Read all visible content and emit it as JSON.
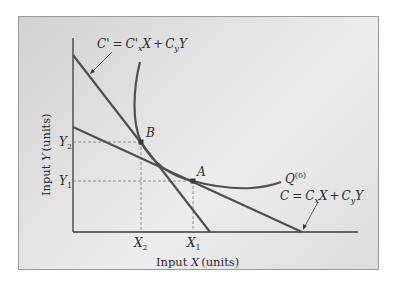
{
  "diagram": {
    "type": "isoquant-isocost",
    "axes": {
      "x_label": "Input X (units)",
      "x_label_var": "X",
      "x_label_prefix": "Input ",
      "x_label_suffix": "(units)",
      "y_label_prefix": "Input ",
      "y_label_var": "Y",
      "y_label_suffix": "(units)"
    },
    "x_ticks": [
      {
        "id": "X2",
        "main": "X",
        "sub": "2"
      },
      {
        "id": "X1",
        "main": "X",
        "sub": "1"
      }
    ],
    "y_ticks": [
      {
        "id": "Y2",
        "main": "Y",
        "sub": "2"
      },
      {
        "id": "Y1",
        "main": "Y",
        "sub": "1"
      }
    ],
    "points": [
      {
        "label": "B",
        "at": [
          "X2",
          "Y2"
        ]
      },
      {
        "label": "A",
        "at": [
          "X1",
          "Y1"
        ]
      }
    ],
    "isoquant": {
      "label_main": "Q",
      "label_sup": "(0)"
    },
    "isocost_original": {
      "equation": "C = CxX + CyY",
      "lhs": "C",
      "c1": "C",
      "c1_sub": "x",
      "v1": "X",
      "plus": "+",
      "c2": "C",
      "c2_sub": "y",
      "v2": "Y"
    },
    "isocost_new": {
      "equation": "C' = C'xX + CyY",
      "lhs": "C'",
      "c1": "C'",
      "c1_sub": "x",
      "v1": "X",
      "plus": "+",
      "c2": "C",
      "c2_sub": "y",
      "v2": "Y"
    },
    "colors": {
      "curve": "#505050",
      "axis": "#3a3a3a",
      "dashed": "#7a7a7a",
      "text": "#2b2b2b"
    }
  }
}
